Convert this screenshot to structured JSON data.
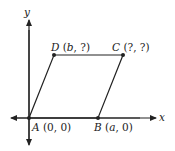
{
  "diagram": {
    "type": "parallelogram on coordinate plane",
    "axes": {
      "x_label": "x",
      "y_label": "y"
    },
    "points": [
      {
        "name": "A",
        "coord": "(0, 0)",
        "x_text": "0",
        "y_text": "0"
      },
      {
        "name": "B",
        "coord": "(a, 0)",
        "x_text": "a",
        "y_text": "0"
      },
      {
        "name": "C",
        "coord": "(?, ?)",
        "x_text": "?",
        "y_text": "?"
      },
      {
        "name": "D",
        "coord": "(b, ?)",
        "x_text": "b",
        "y_text": "?"
      }
    ],
    "edges": [
      "A-B",
      "B-C",
      "C-D",
      "D-A"
    ],
    "colors": {
      "stroke": "#222222",
      "background": "#ffffff"
    }
  }
}
